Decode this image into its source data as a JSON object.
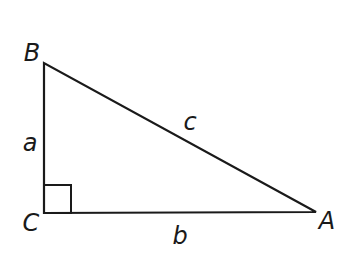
{
  "diagram": {
    "type": "right-triangle",
    "vertices": {
      "B": {
        "label": "B",
        "x": 44,
        "y": 63
      },
      "C": {
        "label": "C",
        "x": 44,
        "y": 213
      },
      "A": {
        "label": "A",
        "x": 316,
        "y": 212
      }
    },
    "sides": {
      "a": {
        "label": "a",
        "between": [
          "B",
          "C"
        ]
      },
      "b": {
        "label": "b",
        "between": [
          "C",
          "A"
        ]
      },
      "c": {
        "label": "c",
        "between": [
          "B",
          "A"
        ]
      }
    },
    "right_angle_at": "C",
    "stroke_color": "#1a1a1a"
  }
}
